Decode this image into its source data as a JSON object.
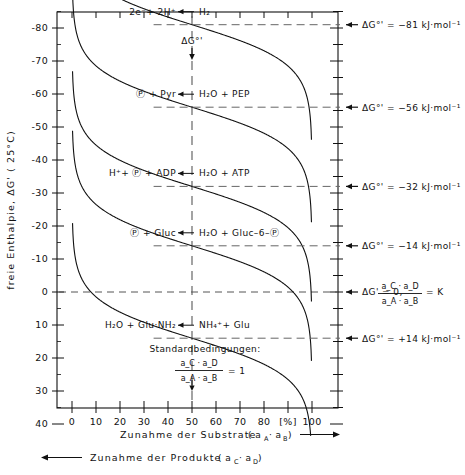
{
  "chart_data": {
    "type": "line",
    "title": "",
    "ylabel": "freie  Enthalpie,  ΔG' ( 25°C)",
    "yunit_label": "[kJ·mol⁻¹]",
    "xlabel_top": "Zunahme der Substrate  ( aₐ·aᴮ ) ⟶",
    "xlabel_bottom": "⟵ Zunahme der Produkte  ( a_C·a_D )",
    "xlabel_top_main": "Zunahme  der  Substrate",
    "xlabel_top_paren": "a",
    "xlabel_bottom_main": "Zunahme  der  Produkte",
    "xlim": [
      -3,
      103
    ],
    "ylim_top": -105,
    "ylim_bottom": 45,
    "y_inverted": true,
    "grid": false,
    "legend_position": "none",
    "x_unit_mark": "[%]",
    "xticks": [
      0,
      10,
      20,
      30,
      40,
      50,
      60,
      70,
      80,
      100
    ],
    "xtick_labels": [
      "0",
      "10",
      "20",
      "30",
      "40",
      "50",
      "60",
      "70",
      "80",
      "100"
    ],
    "yticks": [
      -100,
      -90,
      -80,
      -70,
      -60,
      -50,
      -40,
      -30,
      -20,
      -10,
      0,
      10,
      20,
      30,
      40
    ],
    "ytick_labels": [
      "-100",
      "",
      "-80",
      "-70",
      "-60",
      "-50",
      "-40",
      "-30",
      "-20",
      "-10",
      "0",
      "10",
      "20",
      "30",
      "40"
    ],
    "reference_x": 50,
    "zero_line_y": 0,
    "series": [
      {
        "name": "H2-redox",
        "dG0": -81,
        "label_left": "2e⁻+ 2H⁺",
        "label_right": "H₂",
        "value_label": "ΔG°' = −81 kJ·mol⁻¹"
      },
      {
        "name": "PEP",
        "dG0": -56,
        "label_left": "Ⓟ + Pyr",
        "label_right": "H₂O + PEP",
        "value_label": "ΔG°' = −56 kJ·mol⁻¹"
      },
      {
        "name": "ATP",
        "dG0": -32,
        "label_left": "H⁺+ Ⓟ + ADP",
        "label_right": "H₂O + ATP",
        "value_label": "ΔG°' = −32 kJ·mol⁻¹"
      },
      {
        "name": "Gluc-6-P",
        "dG0": -14,
        "label_left": "Ⓟ + Gluc",
        "label_right": "H₂O + Gluc–6–Ⓟ",
        "value_label": "ΔG°' = −14 kJ·mol⁻¹"
      },
      {
        "name": "Glutamine",
        "dG0": 14,
        "label_left": "H₂O + Glu·NH₂",
        "label_right": "NH₄⁺+ Glu",
        "value_label": "ΔG°' = +14 kJ·mol⁻¹"
      }
    ],
    "equilibrium_annotation": {
      "text": "ΔG' = 0,",
      "fraction_num": "a_C · a_D",
      "fraction_den": "a_A · a_B",
      "equals": "= K"
    },
    "standard_conditions": {
      "title": "Standardbedingungen:",
      "fraction_num": "a_C · a_D",
      "fraction_den": "a_A · a_B",
      "equals": "= 1"
    },
    "delta_g_marker": "ΔG°'"
  },
  "annotations": {
    "dg_marker_label": "ΔG°'",
    "arrow_glyph": "←"
  }
}
